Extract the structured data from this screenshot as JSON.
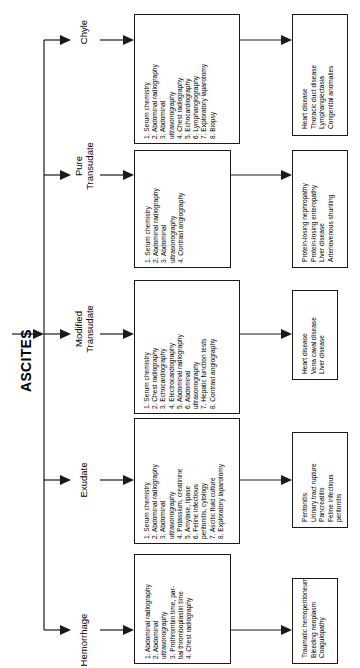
{
  "diagram": {
    "title": "ASCITES",
    "type": "decision-flowchart",
    "orientation": "text-rotated-90-ccw",
    "colors": {
      "line": "#1a1a1a",
      "background": "#ffffff",
      "text": "#000000"
    },
    "branches": [
      {
        "id": "chyle",
        "label": "Chyle",
        "label_line1": "Chyle",
        "label_line2": "",
        "diagnostics": [
          "1. Serum chemistry",
          "2. Abdominal radiography",
          "3. Abdominal ultrasonography",
          "4. Chest radiography",
          "5. Echocardiography",
          "6. Lymphangiography",
          "7. Exploratory laparotomy",
          "8. Biopsy"
        ],
        "diagnostics_wrapped": [
          [
            "1. Serum chemistry"
          ],
          [
            "2. Abdominal radiography"
          ],
          [
            "3. Abdominal",
            "ultrasonography"
          ],
          [
            "4. Chest radiography"
          ],
          [
            "5. Echocardiography"
          ],
          [
            "6. Lymphangiography"
          ],
          [
            "7. Exploratory laparotomy"
          ],
          [
            "8. Biopsy"
          ]
        ],
        "outcomes": [
          "Heart disease",
          "Thoracic duct disease",
          "Lymphangiectasia",
          "Congenital anomalies"
        ]
      },
      {
        "id": "pure-transudate",
        "label": "Pure Transudate",
        "label_line1": "Pure",
        "label_line2": "Transudate",
        "diagnostics": [
          "1. Serum chemistry",
          "2. Abdominal radiography",
          "3. Abdominal ultrasonography",
          "4. Contrast angiography"
        ],
        "diagnostics_wrapped": [
          [
            "1. Serum chemistry"
          ],
          [
            "2. Abdominal radiography"
          ],
          [
            "3. Abdominal",
            "ultrasonography"
          ],
          [
            "4. Contrast angiography"
          ]
        ],
        "outcomes": [
          "Protein-losing nephropathy",
          "Protein-losing enteropathy",
          "Liver disease",
          "Arteriovenous shunting"
        ]
      },
      {
        "id": "modified-transudate",
        "label": "Modified Transudate",
        "label_line1": "Modified",
        "label_line2": "Transudate",
        "diagnostics": [
          "1. Serum chemistry",
          "2. Chest radiography",
          "3. Echocardiography",
          "4. Electrocardiography",
          "5. Abdominal radiography",
          "6. Abdominal ultrasonography",
          "7. Hepatic function tests",
          "8. Contrast angiography"
        ],
        "diagnostics_wrapped": [
          [
            "1. Serum chemistry"
          ],
          [
            "2. Chest radiography"
          ],
          [
            "3. Echocardiography"
          ],
          [
            "4. Electrocardiography"
          ],
          [
            "5. Abdominal radiography"
          ],
          [
            "6. Abdominal",
            "ultrasonography"
          ],
          [
            "7. Hepatic function tests"
          ],
          [
            "8. Contrast angiography"
          ]
        ],
        "outcomes": [
          "Heart disease",
          "Vena caval disease",
          "Liver disease"
        ]
      },
      {
        "id": "exudate",
        "label": "Exudate",
        "label_line1": "Exudate",
        "label_line2": "",
        "diagnostics": [
          "1. Serum chemistry",
          "2. Abdominal radiography",
          "3. Abdominal ultrasonography",
          "4. Potassium, creatinine",
          "5. Amylase, lipase",
          "6. Feline infectious peritonitis, cytology",
          "7. Ascitic fluid culture",
          "8. Exploratory laparotomy"
        ],
        "diagnostics_wrapped": [
          [
            "1. Serum chemistry"
          ],
          [
            "2. Abdominal radiography"
          ],
          [
            "3. Abdominal",
            "ultrasonography"
          ],
          [
            "4. Potassium, creatinine"
          ],
          [
            "5. Amylase, lipase"
          ],
          [
            "6. Feline infectious",
            "peritonitis, cytology"
          ],
          [
            "7. Ascitic fluid culture"
          ],
          [
            "8. Exploratory laparotomy"
          ]
        ],
        "outcomes": [
          "Peritonitis",
          "Urinary tract rupture",
          "Pancreatitis",
          "Feline infectious peritonitis"
        ],
        "outcomes_wrapped": [
          [
            "Peritonitis"
          ],
          [
            "Urinary tract rupture"
          ],
          [
            "Pancreatitis"
          ],
          [
            "Feline infectious",
            "peritonitis"
          ]
        ]
      },
      {
        "id": "hemorrhage",
        "label": "Hemorrhage",
        "label_line1": "Hemorrhage",
        "label_line2": "",
        "diagnostics": [
          "1. Abdominal radiography",
          "2. Abdominal ultrasonography",
          "3. Prothrombin time, partial thromboplastin time",
          "4. Chest radiography"
        ],
        "diagnostics_wrapped": [
          [
            "1. Abdominal radiography"
          ],
          [
            "2. Abdominal",
            "ultrasonography"
          ],
          [
            "3. Prothrombin time, par-",
            "tial thromboplastin time"
          ],
          [
            "4. Chest radiography"
          ]
        ],
        "outcomes": [
          "Traumatic hemoperitoneum",
          "Bleeding neoplasm",
          "Coagulopathy"
        ]
      }
    ]
  }
}
